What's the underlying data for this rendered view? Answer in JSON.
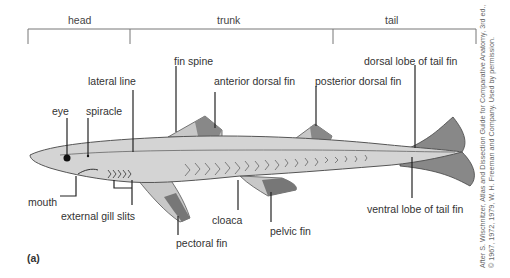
{
  "regions": {
    "head": "head",
    "trunk": "trunk",
    "tail": "tail"
  },
  "labels": {
    "fin_spine": "fin spine",
    "lateral_line": "lateral line",
    "anterior_dorsal_fin": "anterior dorsal fin",
    "posterior_dorsal_fin": "posterior dorsal fin",
    "dorsal_lobe": "dorsal lobe of tail fin",
    "eye": "eye",
    "spiracle": "spiracle",
    "mouth": "mouth",
    "external_gill_slits": "external gill slits",
    "cloaca": "cloaca",
    "pectoral_fin": "pectoral fin",
    "pelvic_fin": "pelvic fin",
    "ventral_lobe": "ventral lobe of tail fin"
  },
  "panel_label": "(a)",
  "credit": {
    "line1": "After S. Wischnitzer, Atlas and Dissection Guide for Comparative Anatomy, 3rd ed.,",
    "line2": "© 1967, 1972, 1979, W. H. Freeman and Company. Used by permission."
  },
  "colors": {
    "body": "#d4d4d4",
    "fin_dark": "#777777",
    "line": "#222222"
  }
}
